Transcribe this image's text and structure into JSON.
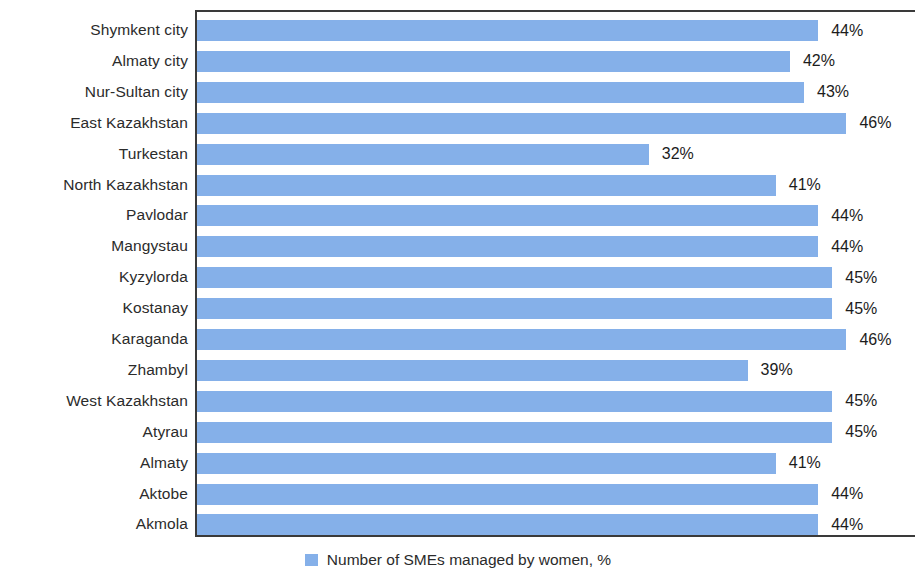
{
  "chart_data": {
    "type": "bar",
    "orientation": "horizontal",
    "title": "",
    "xlabel": "",
    "ylabel": "",
    "xlim": [
      0,
      51
    ],
    "grid": false,
    "legend_position": "bottom",
    "value_label_suffix": "%",
    "bar_color": "#85b0e9",
    "categories": [
      "Shymkent city",
      "Almaty city",
      "Nur-Sultan city",
      "East Kazakhstan",
      "Turkestan",
      "North Kazakhstan",
      "Pavlodar",
      "Mangystau",
      "Kyzylorda",
      "Kostanay",
      "Karaganda",
      "Zhambyl",
      "West Kazakhstan",
      "Atyrau",
      "Almaty",
      "Aktobe",
      "Akmola"
    ],
    "values": [
      44,
      42,
      43,
      46,
      32,
      41,
      44,
      44,
      45,
      45,
      46,
      39,
      45,
      45,
      41,
      44,
      44
    ],
    "value_labels": [
      "44%",
      "42%",
      "43%",
      "46%",
      "32%",
      "41%",
      "44%",
      "44%",
      "45%",
      "45%",
      "46%",
      "39%",
      "45%",
      "45%",
      "41%",
      "44%",
      "44%"
    ],
    "series": [
      {
        "name": "Number of SMEs managed by women, %",
        "values": [
          44,
          42,
          43,
          46,
          32,
          41,
          44,
          44,
          45,
          45,
          46,
          39,
          45,
          45,
          41,
          44,
          44
        ]
      }
    ]
  },
  "legend": {
    "label": "Number of SMEs managed by women, %"
  }
}
